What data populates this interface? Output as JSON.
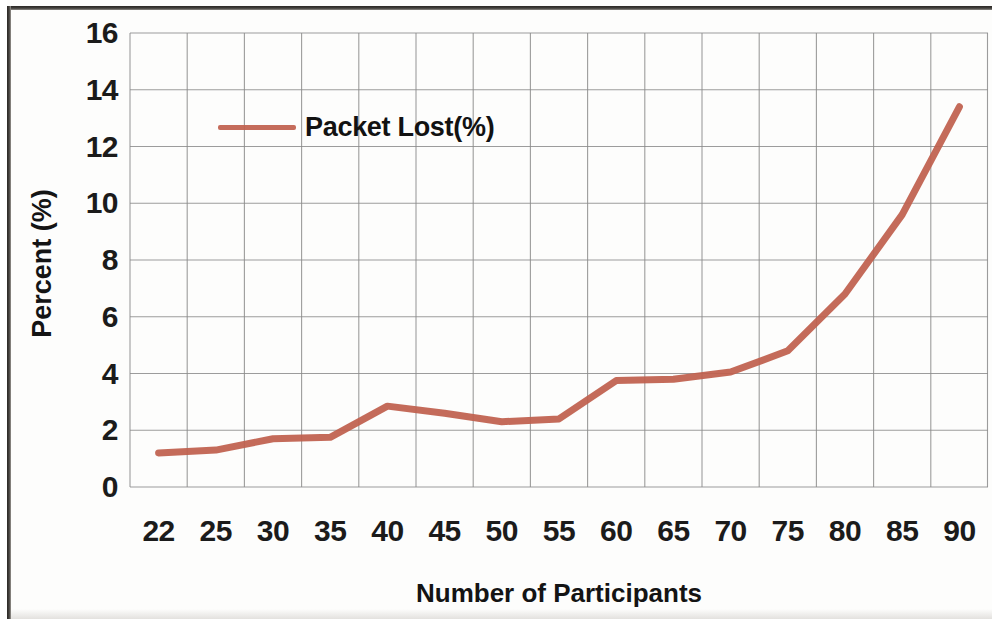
{
  "chart_data": {
    "type": "line",
    "title": "",
    "subtitle": "",
    "xlabel": "Number of Participants",
    "ylabel": "Percent (%)",
    "categories": [
      "22",
      "25",
      "30",
      "35",
      "40",
      "45",
      "50",
      "55",
      "60",
      "65",
      "70",
      "75",
      "80",
      "85",
      "90"
    ],
    "series": [
      {
        "name": "Packet Lost(%)",
        "color": "#C0604D",
        "values": [
          1.2,
          1.3,
          1.7,
          1.75,
          2.85,
          2.6,
          2.3,
          2.4,
          3.75,
          3.8,
          4.05,
          4.8,
          6.8,
          9.6,
          13.4
        ]
      }
    ],
    "ylim": [
      0,
      16
    ],
    "ytick_step": 2,
    "yticks": [
      "16",
      "14",
      "12",
      "10",
      "8",
      "6",
      "4",
      "2",
      "0"
    ],
    "grid": {
      "horizontal": true,
      "vertical": true,
      "color": "#8c8c8c"
    },
    "legend": {
      "position": "inside-top-left",
      "entries": [
        {
          "label": "Packet Lost(%)",
          "color": "#C0604D"
        }
      ]
    },
    "axis_line_color": "#8c8c8c",
    "background": "#ffffff"
  }
}
